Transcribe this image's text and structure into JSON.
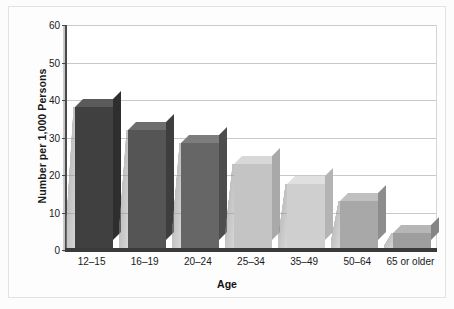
{
  "chart_data": {
    "type": "bar",
    "title": "",
    "subtitle": "",
    "xlabel": "Age",
    "ylabel": "Number per 1,000 Persons",
    "categories": [
      "12–15",
      "16–19",
      "20–24",
      "25–34",
      "35–49",
      "50–64",
      "65 or older"
    ],
    "values": [
      37.5,
      31.5,
      28,
      22.5,
      17,
      12.5,
      4
    ],
    "series": [
      {
        "name": "Number per 1,000 Persons",
        "values": [
          37.5,
          31.5,
          28,
          22.5,
          17,
          12.5,
          4
        ]
      }
    ],
    "ylim": [
      0,
      60
    ],
    "yticks": [
      0,
      10,
      20,
      30,
      40,
      50,
      60
    ],
    "ytick_labels": [
      "0",
      "10",
      "20",
      "30",
      "40",
      "50",
      "60"
    ],
    "grid": true,
    "legend": "none",
    "bar_colors": [
      "#404040",
      "#555555",
      "#666666",
      "#c4c4c4",
      "#cfcfcf",
      "#a8a8a8",
      "#9e9e9e"
    ],
    "bar_top_colors": [
      "#5a5a5a",
      "#6e6e6e",
      "#7d7d7d",
      "#d8d8d8",
      "#e0e0e0",
      "#c0c0c0",
      "#b6b6b6"
    ],
    "bar_side_colors": [
      "#2e2e2e",
      "#3e3e3e",
      "#4d4d4d",
      "#a9a9a9",
      "#b4b4b4",
      "#8d8d8d",
      "#858585"
    ],
    "axis_color": "#3a3a3a",
    "grid_color": "#c9c9c9",
    "plot_background": "#ffffff",
    "figure_background": "#fdfdfd"
  }
}
